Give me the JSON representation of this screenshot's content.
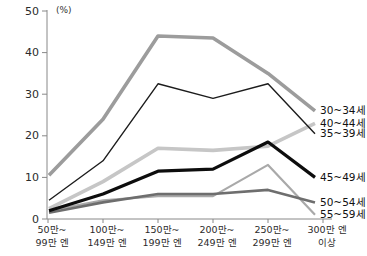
{
  "chart_data": {
    "type": "line",
    "title": "",
    "unit_label": "(%)",
    "xlabel": "",
    "ylabel": "(%)",
    "ylim": [
      0,
      50
    ],
    "y_ticks": [
      0,
      10,
      20,
      30,
      40,
      50
    ],
    "grid": false,
    "legend_position": "right-of-line-ends",
    "categories": [
      [
        "50만~",
        "99만 엔"
      ],
      [
        "100만~",
        "149만 엔"
      ],
      [
        "150만~",
        "199만 엔"
      ],
      [
        "200만~",
        "249만 엔"
      ],
      [
        "250만~",
        "299만 엔"
      ],
      [
        "300만 엔",
        "이상"
      ]
    ],
    "series": [
      {
        "name": "30~34세",
        "values": [
          10.5,
          24,
          44,
          43.5,
          35,
          26
        ],
        "color": "#9c9c9c",
        "width": 3.6
      },
      {
        "name": "40~44세",
        "values": [
          2.5,
          9,
          17,
          16.5,
          17.5,
          23
        ],
        "color": "#c6c6c6",
        "width": 3.6
      },
      {
        "name": "55~59세",
        "values": [
          2,
          4.5,
          5.5,
          5.5,
          13,
          1
        ],
        "color": "#a9a9a9",
        "width": 2.2
      },
      {
        "name": "50~54세",
        "values": [
          1.5,
          4,
          6,
          6,
          7,
          4
        ],
        "color": "#6e6e6e",
        "width": 2.6
      },
      {
        "name": "35~39세",
        "values": [
          4.5,
          14,
          32.5,
          29,
          32.5,
          20.5
        ],
        "color": "#1c1c1c",
        "width": 1.4
      },
      {
        "name": "45~49세",
        "values": [
          2,
          6,
          11.5,
          12,
          18.5,
          10
        ],
        "color": "#0d0d0d",
        "width": 3.2
      }
    ],
    "axis_color": "#888888",
    "text_color": "#2b2b2b"
  }
}
